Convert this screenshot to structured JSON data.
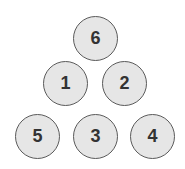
{
  "diagram": {
    "balls": [
      {
        "label": "6",
        "cx": 96,
        "cy": 39
      },
      {
        "label": "1",
        "cx": 66,
        "cy": 84
      },
      {
        "label": "2",
        "cx": 125,
        "cy": 84
      },
      {
        "label": "5",
        "cx": 38,
        "cy": 137
      },
      {
        "label": "3",
        "cx": 96,
        "cy": 137
      },
      {
        "label": "4",
        "cx": 153,
        "cy": 137
      }
    ],
    "colors": {
      "fill": "#e6e6e6",
      "stroke": "#5a5a5a",
      "text": "#333333"
    }
  }
}
